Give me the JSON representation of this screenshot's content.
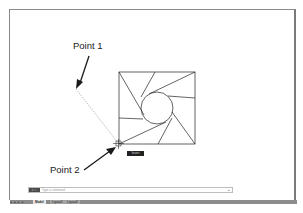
{
  "annotations": {
    "point1": "Point 1",
    "point2": "Point 2"
  },
  "cursor_tooltip": "Insert",
  "command_line": {
    "buttons": "x ✎",
    "placeholder": "Type a command",
    "dropdown_arrow": "▴"
  },
  "status_bar": {
    "nav_buttons": "◂ ◂ ▸ ▸",
    "tabs": [
      {
        "label": "Model",
        "active": true
      },
      {
        "label": "Layout1",
        "active": false
      },
      {
        "label": "Layout2",
        "active": false
      }
    ],
    "add_tab": "+"
  },
  "colors": {
    "frame": "#8a8a8a",
    "status_bar": "#8c8c8c",
    "tooltip_bg": "#222222",
    "rubberband_line": "#b0b0b0"
  }
}
